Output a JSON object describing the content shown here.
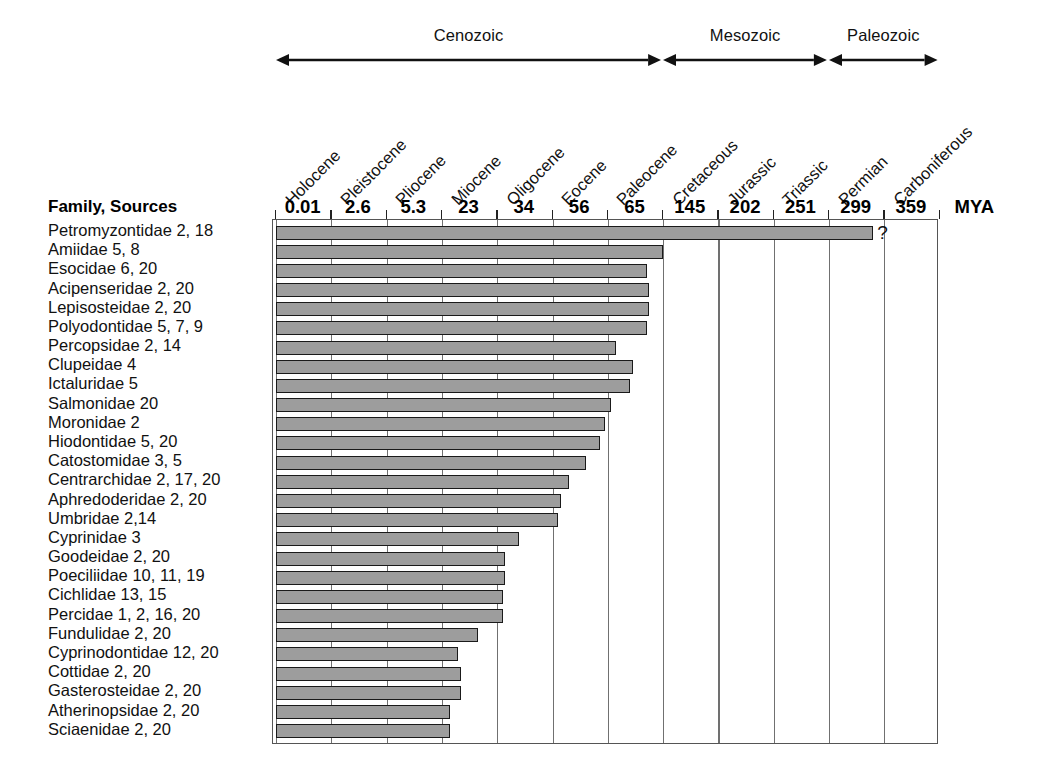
{
  "chart_data": {
    "type": "bar",
    "title": "",
    "xlabel": "MYA",
    "ylabel": "Family, Sources",
    "orientation": "horizontal",
    "axis_note": "Ordinal time axis: ticks evenly spaced, values in millions of years ago (MYA), increasing to the right (older).",
    "grid": true,
    "legend": false,
    "tick_labels": [
      "0.01",
      "2.6",
      "5.3",
      "23",
      "34",
      "56",
      "65",
      "145",
      "202",
      "251",
      "299",
      "359"
    ],
    "tick_values": [
      0.01,
      2.6,
      5.3,
      23,
      34,
      56,
      65,
      145,
      202,
      251,
      299,
      359
    ],
    "axis_unit_label": "MYA",
    "periods": [
      "Holocene",
      "Pleistocene",
      "Pliocene",
      "Miocene",
      "Oligocene",
      "Eocene",
      "Paleocene",
      "Cretaceous",
      "Jurassic",
      "Triassic",
      "Permian",
      "Carboniferous"
    ],
    "eras": [
      {
        "label": "Cenozoic",
        "start_index": 0,
        "end_index": 7
      },
      {
        "label": "Mesozoic",
        "start_index": 7,
        "end_index": 10
      },
      {
        "label": "Paleozoic",
        "start_index": 10,
        "end_index": 12
      }
    ],
    "categories": [
      "Petromyzontidae 2, 18",
      "Amiidae 5, 8",
      "Esocidae 6, 20",
      "Acipenseridae 2, 20",
      "Lepisosteidae 2, 20",
      "Polyodontidae 5, 7, 9",
      "Percopsidae 2, 14",
      "Clupeidae 4",
      "Ictaluridae 5",
      "Salmonidae 20",
      "Moronidae 2",
      "Hiodontidae 5, 20",
      "Catostomidae 3, 5",
      "Centrarchidae 2, 17, 20",
      "Aphredoderidae 2, 20",
      "Umbridae 2,14",
      "Cyprinidae 3",
      "Goodeidae 2, 20",
      "Poeciliidae 10, 11, 19",
      "Cichlidae 13, 15",
      "Percidae 1, 2, 16, 20",
      "Fundulidae 2, 20",
      "Cyprinodontidae 12, 20",
      "Cottidae 2, 20",
      "Gasterosteidae 2, 20",
      "Atherinopsidae 2, 20",
      "Sciaenidae 2, 20"
    ],
    "values": [
      10.8,
      7.0,
      6.7,
      6.75,
      6.75,
      6.7,
      6.15,
      6.45,
      6.4,
      6.05,
      5.95,
      5.85,
      5.6,
      5.3,
      5.15,
      5.1,
      4.4,
      4.15,
      4.15,
      4.1,
      4.1,
      3.65,
      3.3,
      3.35,
      3.35,
      3.15,
      3.15
    ],
    "value_unit": "tick-index position of bar end on ordinal axis",
    "bars": [
      {
        "family": "Petromyzontidae",
        "sources": "2, 18",
        "end_label": "?",
        "end_period": "Permian"
      },
      {
        "family": "Amiidae",
        "sources": "5, 8",
        "end_label": "",
        "end_period": "Cretaceous"
      },
      {
        "family": "Esocidae",
        "sources": "6, 20",
        "end_label": "",
        "end_period": "Cretaceous"
      },
      {
        "family": "Acipenseridae",
        "sources": "2, 20",
        "end_label": "",
        "end_period": "Cretaceous"
      },
      {
        "family": "Lepisosteidae",
        "sources": "2, 20",
        "end_label": "",
        "end_period": "Cretaceous"
      },
      {
        "family": "Polyodontidae",
        "sources": "5, 7, 9",
        "end_label": "",
        "end_period": "Cretaceous"
      },
      {
        "family": "Percopsidae",
        "sources": "2, 14",
        "end_label": "",
        "end_period": "Paleocene"
      },
      {
        "family": "Clupeidae",
        "sources": "4",
        "end_label": "",
        "end_period": "Paleocene"
      },
      {
        "family": "Ictaluridae",
        "sources": "5",
        "end_label": "",
        "end_period": "Paleocene"
      },
      {
        "family": "Salmonidae",
        "sources": "20",
        "end_label": "",
        "end_period": "Paleocene"
      },
      {
        "family": "Moronidae",
        "sources": "2",
        "end_label": "",
        "end_period": "Paleocene"
      },
      {
        "family": "Hiodontidae",
        "sources": "5, 20",
        "end_label": "",
        "end_period": "Eocene"
      },
      {
        "family": "Catostomidae",
        "sources": "3, 5",
        "end_label": "",
        "end_period": "Eocene"
      },
      {
        "family": "Centrarchidae",
        "sources": "2, 17, 20",
        "end_label": "",
        "end_period": "Eocene"
      },
      {
        "family": "Aphredoderidae",
        "sources": "2, 20",
        "end_label": "",
        "end_period": "Eocene"
      },
      {
        "family": "Umbridae",
        "sources": "2,14",
        "end_label": "",
        "end_period": "Eocene"
      },
      {
        "family": "Cyprinidae",
        "sources": "3",
        "end_label": "",
        "end_period": "Oligocene"
      },
      {
        "family": "Goodeidae",
        "sources": "2, 20",
        "end_label": "",
        "end_period": "Oligocene"
      },
      {
        "family": "Poeciliidae",
        "sources": "10, 11, 19",
        "end_label": "",
        "end_period": "Oligocene"
      },
      {
        "family": "Cichlidae",
        "sources": "13, 15",
        "end_label": "",
        "end_period": "Oligocene"
      },
      {
        "family": "Percidae",
        "sources": "1, 2, 16, 20",
        "end_label": "",
        "end_period": "Oligocene"
      },
      {
        "family": "Fundulidae",
        "sources": "2, 20",
        "end_label": "",
        "end_period": "Miocene"
      },
      {
        "family": "Cyprinodontidae",
        "sources": "12, 20",
        "end_label": "",
        "end_period": "Miocene"
      },
      {
        "family": "Cottidae",
        "sources": "2, 20",
        "end_label": "",
        "end_period": "Miocene"
      },
      {
        "family": "Gasterosteidae",
        "sources": "2, 20",
        "end_label": "",
        "end_period": "Miocene"
      },
      {
        "family": "Atherinopsidae",
        "sources": "2, 20",
        "end_label": "",
        "end_period": "Miocene"
      },
      {
        "family": "Sciaenidae",
        "sources": "2, 20",
        "end_label": "",
        "end_period": "Miocene"
      }
    ],
    "colors": {
      "bar_fill": "#9d9d9d",
      "bar_border": "#1a1a1a",
      "gridline": "#707070",
      "frame": "#555555",
      "text": "#111111",
      "background": "#ffffff"
    }
  },
  "header": {
    "row_header": "Family, Sources"
  }
}
